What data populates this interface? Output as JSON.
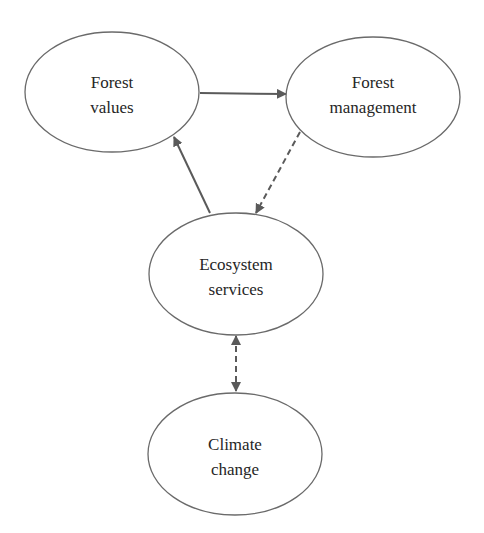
{
  "diagram": {
    "nodes": [
      {
        "id": "forest-values",
        "line1": "Forest",
        "line2": "values"
      },
      {
        "id": "forest-management",
        "line1": "Forest",
        "line2": "management"
      },
      {
        "id": "ecosystem-services",
        "line1": "Ecosystem",
        "line2": "services"
      },
      {
        "id": "climate-change",
        "line1": "Climate",
        "line2": "change"
      }
    ],
    "edges": [
      {
        "from": "forest-values",
        "to": "forest-management",
        "style": "solid",
        "direction": "forward"
      },
      {
        "from": "forest-management",
        "to": "ecosystem-services",
        "style": "dashed",
        "direction": "forward"
      },
      {
        "from": "ecosystem-services",
        "to": "forest-values",
        "style": "solid",
        "direction": "forward"
      },
      {
        "from": "ecosystem-services",
        "to": "climate-change",
        "style": "dashed",
        "direction": "both"
      }
    ],
    "colors": {
      "stroke": "#6a6a6a",
      "edge": "#5a5a5a",
      "text": "#262626",
      "background": "#ffffff"
    }
  }
}
